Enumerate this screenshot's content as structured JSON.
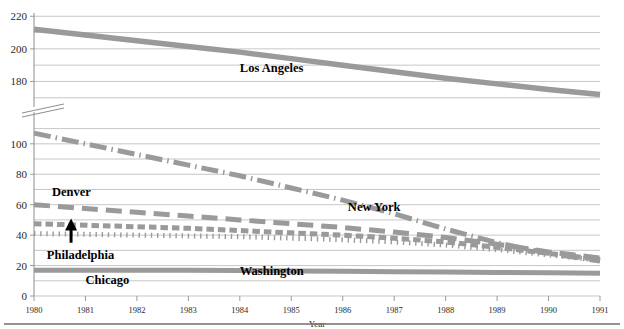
{
  "chart_data": {
    "type": "line",
    "title": "",
    "xlabel": "Year",
    "ylabel": "",
    "x": [
      1980,
      1981,
      1982,
      1983,
      1984,
      1985,
      1986,
      1987,
      1988,
      1989,
      1990,
      1991
    ],
    "xlim": [
      1980,
      1991
    ],
    "axis_break": {
      "lower_max": 115,
      "upper_min": 165,
      "note": "y-axis broken between 115 and 165"
    },
    "ylim_lower": [
      0,
      115
    ],
    "ylim_upper": [
      165,
      225
    ],
    "grid": true,
    "legend_position": "inline-labels",
    "ytick_labels_upper": [
      "180",
      "200",
      "220"
    ],
    "ytick_values_upper": [
      180,
      200,
      220
    ],
    "ygrid_values_upper": [
      170,
      180,
      190,
      200,
      210,
      220
    ],
    "ytick_labels_lower": [
      "0",
      "20",
      "40",
      "60",
      "80",
      "100"
    ],
    "ytick_values_lower": [
      0,
      20,
      40,
      60,
      80,
      100
    ],
    "ygrid_values_lower": [
      0,
      10,
      20,
      30,
      40,
      50,
      60,
      70,
      80,
      90,
      100,
      110
    ],
    "xtick_labels": [
      "1980",
      "1981",
      "1982",
      "1983",
      "1984",
      "1985",
      "1986",
      "1987",
      "1988",
      "1989",
      "1990",
      "1991"
    ],
    "series": [
      {
        "name": "Los Angeles",
        "style": "solid",
        "color": "#9a9a9a",
        "width": 5.5,
        "panel": "upper",
        "label_x": 1984.0,
        "label_y": 186,
        "values": [
          212,
          208.5,
          205,
          201.5,
          198,
          194,
          190,
          186,
          182,
          178.5,
          175,
          172
        ]
      },
      {
        "name": "New York",
        "style": "dashdot",
        "color": "#9a9a9a",
        "width": 5.0,
        "panel": "lower",
        "label_x": 1986.1,
        "label_y": 56,
        "values": [
          107,
          100,
          93,
          86,
          79,
          71,
          63,
          54,
          44,
          35,
          28,
          23
        ]
      },
      {
        "name": "Denver",
        "style": "longdash",
        "color": "#9a9a9a",
        "width": 5.0,
        "panel": "lower",
        "label_x": 1980.35,
        "label_y": 66,
        "values": [
          60,
          57.5,
          55,
          52.5,
          50,
          47.5,
          45,
          42,
          38.5,
          34,
          29,
          25
        ]
      },
      {
        "name": "Washington",
        "style": "shortdash",
        "color": "#9a9a9a",
        "width": 5.0,
        "panel": "lower",
        "label_x": 1984.0,
        "label_y": 13.5,
        "values": [
          47.5,
          46.5,
          45.5,
          44.5,
          43,
          41.5,
          40,
          38,
          35.5,
          32,
          28,
          24
        ]
      },
      {
        "name": "Philadelphia",
        "style": "dotted",
        "color": "#9a9a9a",
        "width": 5.0,
        "panel": "lower",
        "label_x": 1980.25,
        "label_y": 24,
        "values": [
          41,
          40.5,
          40,
          39.5,
          39,
          38,
          37,
          35.5,
          33.5,
          30.5,
          27,
          23.5
        ]
      },
      {
        "name": "Chicago",
        "style": "solid",
        "color": "#9a9a9a",
        "width": 5.0,
        "panel": "lower",
        "label_x": 1981.0,
        "label_y": 8,
        "values": [
          17,
          17,
          17,
          17,
          16.8,
          16.5,
          16.2,
          16,
          15.8,
          15.5,
          15.2,
          15
        ]
      }
    ],
    "annotations": [
      {
        "type": "arrow",
        "name": "up-arrow",
        "x": 1980.72,
        "y_from": 35,
        "y_to": 51,
        "color": "#000000"
      }
    ]
  }
}
